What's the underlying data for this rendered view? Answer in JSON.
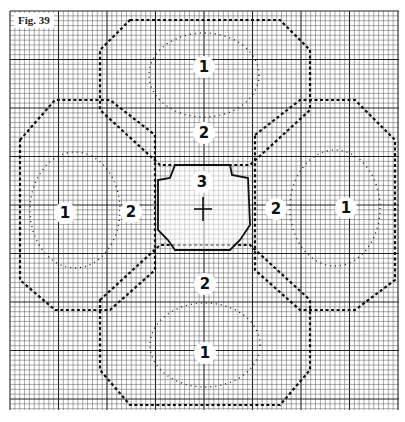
{
  "figure": {
    "label": "Fig. 39"
  },
  "grid": {
    "x0": 10,
    "y0": 11,
    "x1": 399,
    "y1": 410,
    "cell": 4.85,
    "major_every": 10,
    "line_color": "#555555",
    "major_color": "#222222"
  },
  "zones": [
    {
      "id": "top-petal",
      "label": "1",
      "x": 204,
      "y": 67
    },
    {
      "id": "right-petal",
      "label": "1",
      "x": 346,
      "y": 208
    },
    {
      "id": "bottom-petal",
      "label": "1",
      "x": 205,
      "y": 353
    },
    {
      "id": "left-petal",
      "label": "1",
      "x": 65,
      "y": 213
    },
    {
      "id": "inner-top",
      "label": "2",
      "x": 204,
      "y": 133
    },
    {
      "id": "inner-right",
      "label": "2",
      "x": 276,
      "y": 209
    },
    {
      "id": "inner-bottom",
      "label": "2",
      "x": 205,
      "y": 284
    },
    {
      "id": "inner-left",
      "label": "2",
      "x": 131,
      "y": 212
    },
    {
      "id": "center",
      "label": "3",
      "x": 202,
      "y": 182
    }
  ],
  "center_mark": {
    "x": 203,
    "y": 209
  }
}
